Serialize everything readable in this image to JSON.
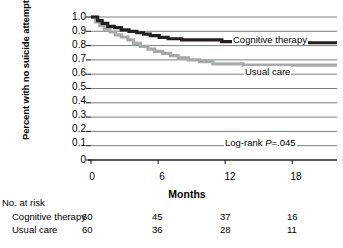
{
  "chart_data": {
    "type": "line",
    "title": "",
    "xlabel": "Months",
    "ylabel": "Percent with no suicide attempts",
    "xlim": [
      0,
      22
    ],
    "ylim": [
      0,
      1.0
    ],
    "grid": true,
    "legend_position": "inline-right-annotations",
    "xticks": [
      "0",
      "6",
      "12",
      "18"
    ],
    "xtick_values": [
      0,
      6,
      12,
      18
    ],
    "yticks": [
      "0",
      "0.1",
      "0.2",
      "0.3",
      "0.4",
      "0.5",
      "0.6",
      "0.7",
      "0.8",
      "0.9",
      "1.0"
    ],
    "ytick_values": [
      0,
      0.1,
      0.2,
      0.3,
      0.4,
      0.5,
      0.6,
      0.7,
      0.8,
      0.9,
      1.0
    ],
    "annotations": [
      {
        "name": "cognitive-therapy-label",
        "text": "Cognitive therapy"
      },
      {
        "name": "usual-care-label",
        "text": "Usual care"
      },
      {
        "name": "logrank-label",
        "text": "Log-rank ",
        "italic": "P",
        "tail": "=.045"
      }
    ],
    "series": [
      {
        "name": "Cognitive therapy",
        "color": "#231f20",
        "step": true,
        "points": [
          [
            0.0,
            1.0
          ],
          [
            0.5,
            1.0
          ],
          [
            0.6,
            0.975
          ],
          [
            0.9,
            0.975
          ],
          [
            1.0,
            0.955
          ],
          [
            1.4,
            0.955
          ],
          [
            1.5,
            0.935
          ],
          [
            2.0,
            0.935
          ],
          [
            2.1,
            0.925
          ],
          [
            2.6,
            0.925
          ],
          [
            2.7,
            0.91
          ],
          [
            3.3,
            0.91
          ],
          [
            3.4,
            0.9
          ],
          [
            4.0,
            0.9
          ],
          [
            4.1,
            0.89
          ],
          [
            4.6,
            0.89
          ],
          [
            4.7,
            0.88
          ],
          [
            5.2,
            0.88
          ],
          [
            5.3,
            0.87
          ],
          [
            6.0,
            0.87
          ],
          [
            6.1,
            0.858
          ],
          [
            6.8,
            0.858
          ],
          [
            6.9,
            0.848
          ],
          [
            8.0,
            0.848
          ],
          [
            8.1,
            0.84
          ],
          [
            11.6,
            0.84
          ],
          [
            11.7,
            0.828
          ],
          [
            15.5,
            0.828
          ],
          [
            15.6,
            0.82
          ],
          [
            22.0,
            0.82
          ]
        ]
      },
      {
        "name": "Usual care",
        "color": "#a7a9ac",
        "step": true,
        "points": [
          [
            0.0,
            1.0
          ],
          [
            0.3,
            1.0
          ],
          [
            0.4,
            0.965
          ],
          [
            0.7,
            0.965
          ],
          [
            0.8,
            0.94
          ],
          [
            1.1,
            0.94
          ],
          [
            1.2,
            0.915
          ],
          [
            1.6,
            0.915
          ],
          [
            1.7,
            0.895
          ],
          [
            2.1,
            0.895
          ],
          [
            2.2,
            0.875
          ],
          [
            2.6,
            0.875
          ],
          [
            2.7,
            0.86
          ],
          [
            3.2,
            0.86
          ],
          [
            3.3,
            0.84
          ],
          [
            3.7,
            0.84
          ],
          [
            3.8,
            0.815
          ],
          [
            4.3,
            0.815
          ],
          [
            4.4,
            0.795
          ],
          [
            5.0,
            0.795
          ],
          [
            5.1,
            0.775
          ],
          [
            5.6,
            0.775
          ],
          [
            5.7,
            0.76
          ],
          [
            6.3,
            0.76
          ],
          [
            6.4,
            0.745
          ],
          [
            7.0,
            0.745
          ],
          [
            7.1,
            0.73
          ],
          [
            7.7,
            0.73
          ],
          [
            7.8,
            0.715
          ],
          [
            8.6,
            0.715
          ],
          [
            8.7,
            0.7
          ],
          [
            9.6,
            0.7
          ],
          [
            9.7,
            0.688
          ],
          [
            10.8,
            0.688
          ],
          [
            10.9,
            0.672
          ],
          [
            13.5,
            0.672
          ],
          [
            13.6,
            0.663
          ],
          [
            22.0,
            0.663
          ]
        ]
      }
    ],
    "risk_table": {
      "title": "No. at risk",
      "time_points": [
        0,
        6,
        12,
        18
      ],
      "rows": [
        {
          "label": "Cognitive therapy",
          "values": [
            "60",
            "45",
            "37",
            "16"
          ]
        },
        {
          "label": "Usual care",
          "values": [
            "60",
            "36",
            "28",
            "11"
          ]
        }
      ]
    },
    "colors": {
      "cognitive_therapy": "#231f20",
      "usual_care": "#a7a9ac",
      "gridline": "#6d6e71",
      "axis": "#231f20"
    }
  }
}
